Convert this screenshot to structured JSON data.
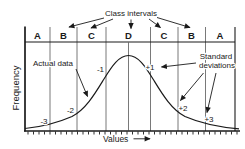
{
  "figure": {
    "class_intervals_label": "Class intervals",
    "class_letters": [
      "A",
      "B",
      "C",
      "D",
      "C",
      "B",
      "A"
    ],
    "sd_values": [
      "-3",
      "-2",
      "-1",
      "+1",
      "+2",
      "+3"
    ],
    "actual_data_label": "Actual data",
    "std_dev_label_line1": "Standard",
    "std_dev_label_line2": "deviations",
    "y_axis_label": "Frequency",
    "x_axis_label": "Values",
    "colors": {
      "ink": "#1a1a1a",
      "grid_line": "#6a6a6a",
      "background": "#ffffff"
    }
  }
}
